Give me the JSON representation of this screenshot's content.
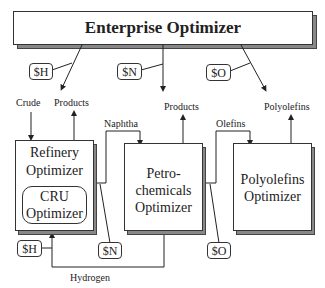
{
  "enterprise": {
    "title": "Enterprise Optimizer"
  },
  "price_tags": {
    "top_h": "$H",
    "top_n": "$N",
    "top_o": "$O",
    "bottom_h": "$H",
    "bottom_n": "$N",
    "bottom_o": "$O"
  },
  "refinery": {
    "line1": "Refinery",
    "line2": "Optimizer"
  },
  "cru": {
    "line1": "CRU",
    "line2": "Optimizer"
  },
  "petro": {
    "line1": "Petro-",
    "line2": "chemicals",
    "line3": "Optimizer"
  },
  "poly": {
    "line1": "Polyolefins",
    "line2": "Optimizer"
  },
  "labels": {
    "crude": "Crude",
    "refinery_products": "Products",
    "naphtha": "Naphtha",
    "petro_products": "Products",
    "olefins": "Olefins",
    "polyolefins": "Polyolefins",
    "hydrogen": "Hydrogen"
  }
}
